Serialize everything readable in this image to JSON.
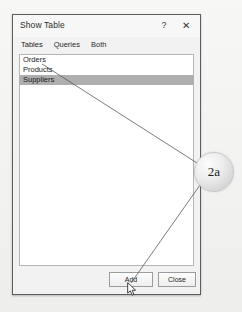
{
  "dialog": {
    "title": "Show Table",
    "help_icon": "?",
    "close_icon": "✕",
    "tabs": [
      {
        "label": "Tables",
        "selected": true
      },
      {
        "label": "Queries",
        "selected": false
      },
      {
        "label": "Both",
        "selected": false
      }
    ],
    "list": {
      "items": [
        {
          "label": "Orders",
          "selected": false
        },
        {
          "label": "Products",
          "selected": false
        },
        {
          "label": "Suppliers",
          "selected": true
        }
      ]
    },
    "buttons": {
      "add_label": "Add",
      "close_label": "Close"
    }
  },
  "annotation": {
    "callout_label": "2a",
    "line_color": "#5a5a5a"
  },
  "icons": {
    "help": "help-icon",
    "close": "close-icon",
    "cursor": "mouse-pointer-icon"
  },
  "colors": {
    "selection": "#aeaeae",
    "dialog_border": "#5d5d5d",
    "dialog_bg": "#f2f2f2",
    "list_bg": "#ffffff"
  }
}
